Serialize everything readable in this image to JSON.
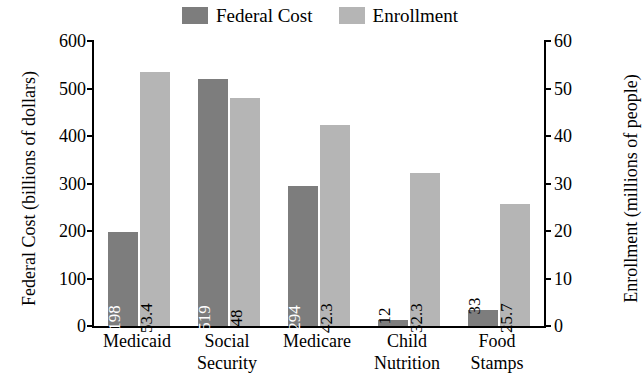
{
  "chart_data": {
    "type": "bar",
    "title": "",
    "categories": [
      "Medicaid",
      "Social Security",
      "Medicare",
      "Child Nutrition",
      "Food Stamps"
    ],
    "category_lines": [
      [
        "Medicaid"
      ],
      [
        "Social",
        "Security"
      ],
      [
        "Medicare"
      ],
      [
        "Child",
        "Nutrition"
      ],
      [
        "Food",
        "Stamps"
      ]
    ],
    "series": [
      {
        "name": "Federal Cost",
        "axis": "left",
        "color": "#7d7d7d",
        "values": [
          198,
          519,
          294,
          12,
          33
        ],
        "value_labels": [
          "198",
          "519",
          "294",
          "12",
          "33"
        ]
      },
      {
        "name": "Enrollment",
        "axis": "right",
        "color": "#b5b5b5",
        "values": [
          53.4,
          48,
          42.3,
          32.3,
          25.7
        ],
        "value_labels": [
          "53.4",
          "48",
          "42.3",
          "32.3",
          "25.7"
        ]
      }
    ],
    "xlabel": "",
    "ylabel_left": "Federal Cost (billions of dollars)",
    "ylabel_right": "Enrollment (millions of people)",
    "ylim_left": [
      0,
      600
    ],
    "ylim_right": [
      0,
      60
    ],
    "yticks_left": [
      "0",
      "100",
      "200",
      "300",
      "400",
      "500",
      "600"
    ],
    "yticks_right": [
      "0",
      "10",
      "20",
      "30",
      "40",
      "50",
      "60"
    ],
    "grid": false,
    "legend_position": "top-center"
  },
  "legend": {
    "items": [
      {
        "label": "Federal Cost",
        "color": "#7d7d7d"
      },
      {
        "label": "Enrollment",
        "color": "#b5b5b5"
      }
    ]
  }
}
